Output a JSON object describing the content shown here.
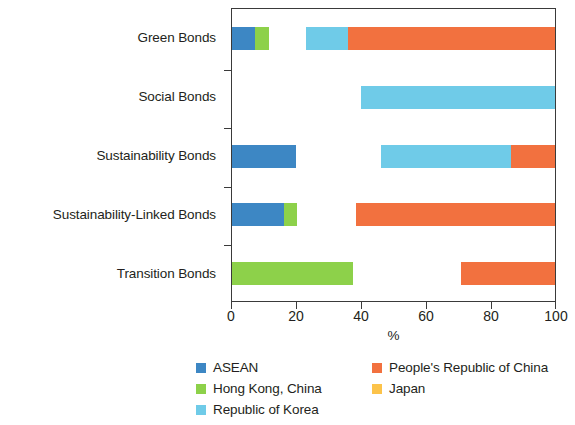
{
  "chart_data": {
    "type": "bar",
    "orientation": "horizontal",
    "stacked": true,
    "normalized": true,
    "title": "",
    "subtitle": "",
    "xlabel": "%",
    "ylabel": "",
    "xlim": [
      0,
      100
    ],
    "xticks": [
      0,
      20,
      40,
      60,
      80,
      100
    ],
    "xticklabels": [
      "0",
      "20",
      "40",
      "60",
      "80",
      "100"
    ],
    "grid": false,
    "legend_position": "bottom",
    "categories": [
      "Green Bonds",
      "Social Bonds",
      "Sustainability Bonds",
      "Sustainability-Linked Bonds",
      "Transition Bonds"
    ],
    "series": [
      {
        "name": "ASEAN",
        "color": "#3d87c4",
        "values": [
          7.1,
          0.0,
          19.7,
          16.0,
          0.0
        ]
      },
      {
        "name": "Hong Kong, China",
        "color": "#8dd14a",
        "values": [
          4.3,
          0.0,
          0.0,
          4.0,
          37.5
        ]
      },
      {
        "name": "Japan",
        "color": "#fcc council",
        "values": [
          11.6,
          40.0,
          26.5,
          18.5,
          33.3
        ]
      },
      {
        "name": "Republic of Korea",
        "color": "#6fcbe8",
        "values": [
          13.0,
          60.0,
          40.3,
          0.0,
          0.0
        ]
      },
      {
        "name": "People's Republic of China",
        "color": "#f2713f",
        "values": [
          64.0,
          0.0,
          13.5,
          61.5,
          29.2
        ]
      }
    ],
    "segment_order": [
      "ASEAN",
      "Hong Kong, China",
      "Japan",
      "Republic of Korea",
      "People's Republic of China"
    ]
  },
  "legend": {
    "items": [
      {
        "label": "ASEAN",
        "color": "#3d87c4"
      },
      {
        "label": "People's Republic of China",
        "color": "#f2713f"
      },
      {
        "label": "Hong Kong, China",
        "color": "#8dd14a"
      },
      {
        "label": "Japan",
        "color": "#fcc34a"
      },
      {
        "label": "Republic of Korea",
        "color": "#6fcbe8"
      }
    ]
  },
  "axis": {
    "x_title": "%",
    "x_tick_labels": [
      "0",
      "20",
      "40",
      "60",
      "80",
      "100"
    ]
  }
}
